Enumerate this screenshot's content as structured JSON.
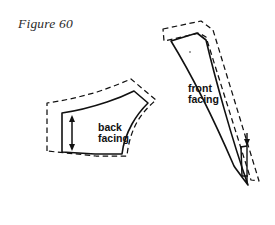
{
  "figure": {
    "caption": "Figure 60"
  },
  "pieces": [
    {
      "id": "back-facing",
      "label_line1": "back",
      "label_line2": "facing",
      "cut_line_style": "solid",
      "seam_allowance_style": "dashed",
      "has_depth_arrow": true
    },
    {
      "id": "front-facing",
      "label_line1": "front",
      "label_line2": "facing",
      "cut_line_style": "solid",
      "seam_allowance_style": "dashed",
      "has_depth_arrow": true
    }
  ],
  "colors": {
    "ink": "#111111",
    "caption_ink": "#2b2b2b",
    "paper": "#ffffff"
  },
  "geometry": {
    "back_facing_solid_path": "M 62 152 L 62 113 L 97 108 L 122 101 L 133 97 L 147 106 L 145 108 L 134 118 L 128 129 L 124 142 L 122 154 L 95 154 L 62 152 Z",
    "back_facing_dashed_path": "M 47 152 L 47 104 L 83 98 L 112 90 L 130 83 L 155 101 L 154 104 L 142 114 L 135 127 L 130 142 L 128 156 L 96 156 L 47 152 Z",
    "front_facing_solid_path": "M 171 40 L 198 33 L 206 39 L 248 185 L 235 178 L 171 40 Z",
    "front_facing_dashed_path": "M 161 30 L 200 22 L 212 30 L 258 182 L 256 183 L 250 180 L 207 38 L 199 34 L 162 41 Z",
    "back_arrow": {
      "x": 72,
      "y1": 118,
      "y2": 148
    },
    "front_bracket": {
      "x": 242,
      "y1": 145,
      "y2": 175,
      "width": 6
    },
    "front_arrow": {
      "x": 248,
      "y1": 130,
      "y2": 186
    }
  },
  "annotations": {
    "back_label_x": 98,
    "back_label_y1": 129,
    "back_label_y2": 140,
    "front_label_x": 196,
    "front_label_y1": 90,
    "front_label_y2": 101
  }
}
